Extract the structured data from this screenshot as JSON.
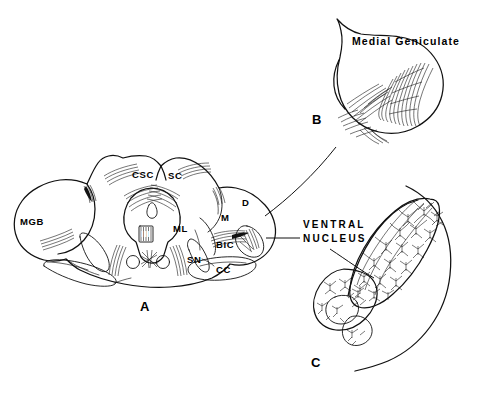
{
  "figure": {
    "background_color": "#ffffff",
    "ink_color": "#111111",
    "panels": [
      {
        "id": "A",
        "letter": "A",
        "description": "Transverse section through midbrain and caudal thalamus"
      },
      {
        "id": "B",
        "letter": "B",
        "title": "Medial  Geniculate",
        "description": "Enlargement of medial geniculate body showing fiber architecture"
      },
      {
        "id": "C",
        "letter": "C",
        "description": "Golgi preparation of ventral nucleus showing neurons and dendritic tufts"
      }
    ]
  },
  "panel_a": {
    "letter": "A",
    "abbreviations": [
      {
        "key": "MGB",
        "label": "MGB",
        "x": 20,
        "y": 222
      },
      {
        "key": "CSC",
        "label": "CSC",
        "x": 132,
        "y": 171
      },
      {
        "key": "SC",
        "label": "SC",
        "x": 168,
        "y": 172
      },
      {
        "key": "III",
        "label": "III",
        "x": 143,
        "y": 233
      },
      {
        "key": "ML",
        "label": "ML",
        "x": 178,
        "y": 226
      },
      {
        "key": "M",
        "label": "M",
        "x": 222,
        "y": 216
      },
      {
        "key": "D",
        "label": "D",
        "x": 243,
        "y": 201
      },
      {
        "key": "BIC",
        "label": "BIC",
        "x": 219,
        "y": 243
      },
      {
        "key": "SN",
        "label": "SN",
        "x": 189,
        "y": 258
      },
      {
        "key": "CC",
        "label": "CC",
        "x": 218,
        "y": 268
      }
    ]
  },
  "panel_b": {
    "letter": "B",
    "title": "Medial  Geniculate",
    "title_x": 352,
    "title_y": 41,
    "letter_x": 312,
    "letter_y": 118
  },
  "panel_c": {
    "letter": "C",
    "callout_line1": "VENTRAL",
    "callout_line2": "NUCLEUS",
    "callout_x": 303,
    "callout_y": 219,
    "letter_x": 311,
    "letter_y": 361
  }
}
